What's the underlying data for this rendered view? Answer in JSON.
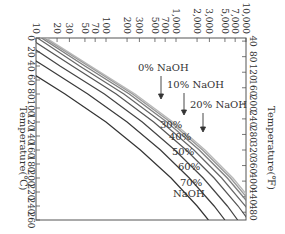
{
  "chart_data": {
    "type": "line",
    "title": "",
    "orientation_note": "rotated 90 degrees clockwise",
    "xlabel": "Temperature(℃)",
    "x2label": "Temperature(℉)",
    "ylabel": "Pressure",
    "x_ticks_celsius": [
      0,
      20,
      40,
      60,
      80,
      100,
      120,
      140,
      160,
      180,
      200,
      220,
      240,
      260
    ],
    "x_ticks_fahrenheit": [
      40,
      80,
      120,
      160,
      200,
      240,
      280,
      320,
      360,
      400,
      440,
      480
    ],
    "y_ticks": [
      "10",
      "20",
      "30",
      "50",
      "70",
      "100",
      "200",
      "300",
      "500",
      "700",
      "1,000",
      "2,000",
      "3,000",
      "5,000",
      "7,000",
      "10,000"
    ],
    "y_scale": "log",
    "xlim": [
      0,
      260
    ],
    "ylim": [
      10,
      10000
    ],
    "grid": false,
    "series": [
      {
        "name": "0% NaOH",
        "x": [
          0,
          40,
          80,
          120,
          160,
          200,
          240,
          260
        ],
        "values": [
          14,
          60,
          260,
          900,
          2600,
          6500,
          14000,
          20000
        ]
      },
      {
        "name": "10% NaOH",
        "x": [
          0,
          40,
          80,
          120,
          160,
          200,
          240,
          260
        ],
        "values": [
          13,
          56,
          240,
          830,
          2400,
          6000,
          13000,
          18500
        ]
      },
      {
        "name": "20% NaOH",
        "x": [
          0,
          40,
          80,
          120,
          160,
          200,
          240,
          260
        ],
        "values": [
          12,
          50,
          215,
          740,
          2150,
          5400,
          11800,
          16500
        ]
      },
      {
        "name": "30%",
        "x": [
          0,
          40,
          80,
          120,
          160,
          200,
          240,
          260
        ],
        "values": [
          10.5,
          42,
          180,
          620,
          1800,
          4500,
          9800,
          13800
        ]
      },
      {
        "name": "40%",
        "x": [
          0,
          40,
          80,
          120,
          160,
          200,
          240,
          260
        ],
        "values": [
          8,
          33,
          140,
          480,
          1400,
          3500,
          7700,
          10800
        ]
      },
      {
        "name": "50%",
        "x": [
          0,
          40,
          80,
          120,
          160,
          200,
          240,
          260
        ],
        "values": [
          5.5,
          22,
          95,
          330,
          960,
          2450,
          5400,
          7600
        ]
      },
      {
        "name": "60%",
        "x": [
          0,
          40,
          80,
          120,
          160,
          200,
          240,
          260
        ],
        "values": [
          3,
          13,
          55,
          200,
          600,
          1550,
          3500,
          5000
        ]
      },
      {
        "name": "70% NaOH",
        "x": [
          0,
          40,
          80,
          120,
          160,
          200,
          240,
          260
        ],
        "values": [
          1.3,
          6,
          26,
          100,
          310,
          850,
          2000,
          2900
        ]
      }
    ],
    "annotations": [
      "0% NaOH",
      "10% NaOH",
      "20% NaOH",
      "30%",
      "40%",
      "50%",
      "60%",
      "70%",
      "NaOH"
    ]
  },
  "labels": {
    "axis_celsius": "Temperature(℃)",
    "axis_fahrenheit": "Temperature(℉)",
    "l0": "0% NaOH",
    "l10": "10% NaOH",
    "l20": "20% NaOH",
    "l30": "30%",
    "l40": "40%",
    "l50": "50%",
    "l60": "60%",
    "l70a": "70%",
    "l70b": "NaOH"
  }
}
